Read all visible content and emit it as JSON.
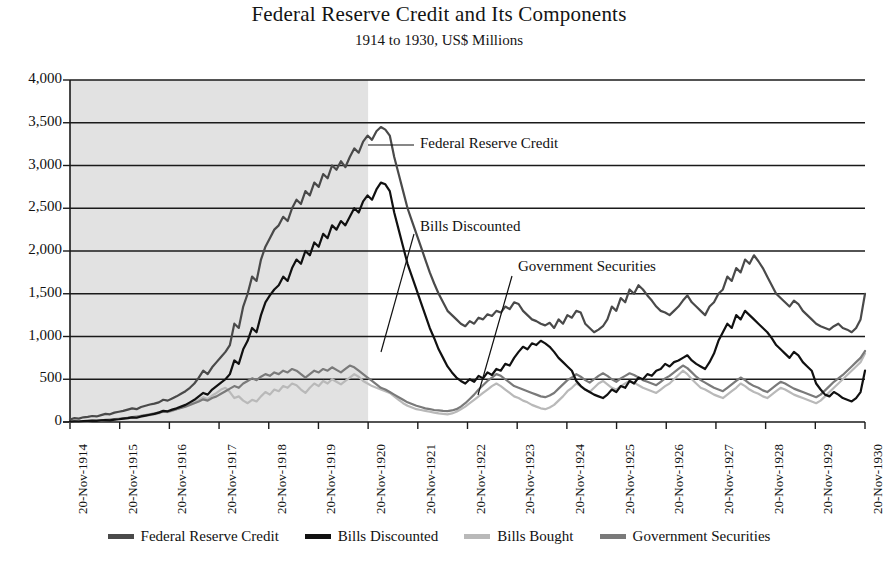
{
  "header": {
    "title": "Federal Reserve Credit and Its Components",
    "subtitle": "1914 to 1930, US$ Millions"
  },
  "footer": {
    "fragment": ""
  },
  "colors": {
    "federal_reserve_credit": "#4a4a4a",
    "bills_discounted": "#111111",
    "bills_bought": "#b9b9b9",
    "government_securities": "#7a7a7a",
    "shading": "#e2e2e2",
    "gridline": "#1a1a1a",
    "axis": "#1a1a1a"
  },
  "legend": {
    "position": "bottom",
    "items": [
      {
        "label": "Federal Reserve Credit",
        "color": "#4a4a4a"
      },
      {
        "label": "Bills Discounted",
        "color": "#111111"
      },
      {
        "label": "Bills Bought",
        "color": "#b9b9b9"
      },
      {
        "label": "Government Securities",
        "color": "#7a7a7a"
      }
    ]
  },
  "annotations": [
    {
      "label": "Federal Reserve Credit",
      "x": 420,
      "y": 145
    },
    {
      "label": "Bills Discounted",
      "x": 420,
      "y": 228
    },
    {
      "label": "Government Securities",
      "x": 518,
      "y": 268
    }
  ],
  "chart_data": {
    "type": "line",
    "title": "Federal Reserve Credit and Its Components",
    "subtitle": "1914 to 1930, US$ Millions",
    "xlabel": "",
    "ylabel": "US$ Millions",
    "ylim": [
      0,
      4000
    ],
    "yticks": [
      "0",
      "500",
      "1,000",
      "1,500",
      "2,000",
      "2,500",
      "3,000",
      "3,500",
      "4,000"
    ],
    "ytick_values": [
      0,
      500,
      1000,
      1500,
      2000,
      2500,
      3000,
      3500,
      4000
    ],
    "grid": true,
    "xtick_labels": [
      "20-Nov-1914",
      "20-Nov-1915",
      "20-Nov-1916",
      "20-Nov-1917",
      "20-Nov-1918",
      "20-Nov-1919",
      "20-Nov-1920",
      "20-Nov-1921",
      "20-Nov-1922",
      "20-Nov-1923",
      "20-Nov-1924",
      "20-Nov-1925",
      "20-Nov-1926",
      "20-Nov-1927",
      "20-Nov-1928",
      "20-Nov-1929",
      "20-Nov-1930"
    ],
    "shaded_region": {
      "from": "20-Nov-1914",
      "to": "20-Nov-1920",
      "color": "#e2e2e2"
    },
    "series": [
      {
        "name": "Federal Reserve Credit",
        "color": "#4a4a4a",
        "values": [
          30,
          45,
          40,
          55,
          60,
          70,
          65,
          80,
          95,
          90,
          110,
          120,
          130,
          145,
          160,
          150,
          175,
          190,
          205,
          215,
          230,
          260,
          250,
          275,
          300,
          330,
          360,
          400,
          450,
          520,
          600,
          560,
          640,
          700,
          760,
          820,
          900,
          1150,
          1100,
          1350,
          1500,
          1700,
          1650,
          1900,
          2050,
          2150,
          2250,
          2300,
          2400,
          2350,
          2500,
          2600,
          2550,
          2700,
          2650,
          2800,
          2750,
          2900,
          2850,
          3000,
          2950,
          3050,
          2980,
          3100,
          3200,
          3150,
          3280,
          3350,
          3300,
          3400,
          3450,
          3420,
          3350,
          3100,
          2900,
          2700,
          2500,
          2350,
          2200,
          2050,
          1900,
          1750,
          1620,
          1500,
          1400,
          1300,
          1250,
          1200,
          1150,
          1120,
          1180,
          1150,
          1220,
          1200,
          1260,
          1240,
          1300,
          1280,
          1350,
          1320,
          1400,
          1380,
          1300,
          1250,
          1200,
          1180,
          1150,
          1130,
          1160,
          1100,
          1200,
          1150,
          1250,
          1220,
          1300,
          1280,
          1150,
          1100,
          1050,
          1080,
          1120,
          1200,
          1350,
          1300,
          1450,
          1400,
          1550,
          1500,
          1600,
          1550,
          1480,
          1420,
          1350,
          1300,
          1280,
          1250,
          1300,
          1350,
          1420,
          1480,
          1400,
          1350,
          1300,
          1250,
          1350,
          1400,
          1500,
          1550,
          1700,
          1650,
          1800,
          1750,
          1900,
          1850,
          1950,
          1880,
          1800,
          1700,
          1600,
          1500,
          1450,
          1400,
          1350,
          1420,
          1380,
          1300,
          1250,
          1200,
          1150,
          1120,
          1100,
          1080,
          1120,
          1150,
          1100,
          1080,
          1050,
          1100,
          1200,
          1500
        ],
        "peak": 3450,
        "peak_date": "20-Nov-1920"
      },
      {
        "name": "Bills Discounted",
        "color": "#111111",
        "values": [
          5,
          8,
          6,
          10,
          12,
          15,
          14,
          18,
          22,
          20,
          28,
          32,
          40,
          45,
          55,
          50,
          65,
          75,
          85,
          95,
          110,
          130,
          125,
          145,
          160,
          180,
          200,
          230,
          260,
          300,
          340,
          320,
          380,
          420,
          460,
          500,
          560,
          720,
          680,
          850,
          950,
          1100,
          1050,
          1250,
          1400,
          1480,
          1550,
          1600,
          1700,
          1650,
          1800,
          1900,
          1850,
          2000,
          1950,
          2100,
          2050,
          2200,
          2150,
          2300,
          2250,
          2350,
          2300,
          2400,
          2500,
          2450,
          2580,
          2650,
          2600,
          2720,
          2800,
          2780,
          2700,
          2450,
          2250,
          2050,
          1850,
          1700,
          1550,
          1400,
          1250,
          1100,
          980,
          850,
          750,
          650,
          580,
          520,
          480,
          450,
          500,
          470,
          540,
          510,
          580,
          550,
          620,
          600,
          680,
          660,
          750,
          820,
          880,
          850,
          920,
          900,
          950,
          920,
          880,
          820,
          750,
          700,
          650,
          600,
          480,
          420,
          380,
          350,
          320,
          300,
          280,
          320,
          380,
          350,
          420,
          400,
          480,
          450,
          520,
          500,
          560,
          540,
          600,
          620,
          680,
          650,
          700,
          720,
          750,
          780,
          720,
          680,
          650,
          620,
          700,
          800,
          950,
          1050,
          1150,
          1100,
          1250,
          1200,
          1300,
          1250,
          1200,
          1150,
          1100,
          1050,
          980,
          900,
          850,
          800,
          750,
          820,
          780,
          700,
          650,
          600,
          450,
          380,
          320,
          300,
          350,
          320,
          280,
          260,
          240,
          280,
          350,
          600
        ],
        "peak": 2800,
        "peak_date": "20-Nov-1920"
      },
      {
        "name": "Bills Bought",
        "color": "#b9b9b9",
        "values": [
          2,
          4,
          6,
          8,
          10,
          12,
          15,
          18,
          22,
          25,
          30,
          35,
          40,
          45,
          50,
          55,
          60,
          70,
          80,
          90,
          100,
          120,
          115,
          130,
          150,
          170,
          190,
          210,
          230,
          260,
          290,
          270,
          310,
          340,
          380,
          400,
          350,
          280,
          300,
          250,
          220,
          260,
          240,
          300,
          350,
          320,
          380,
          360,
          420,
          400,
          450,
          430,
          380,
          340,
          400,
          450,
          420,
          480,
          450,
          500,
          470,
          440,
          480,
          520,
          560,
          530,
          480,
          450,
          420,
          400,
          380,
          360,
          340,
          300,
          260,
          220,
          190,
          170,
          150,
          140,
          130,
          120,
          110,
          100,
          95,
          90,
          100,
          120,
          150,
          180,
          220,
          260,
          300,
          340,
          380,
          420,
          450,
          420,
          380,
          340,
          300,
          280,
          250,
          230,
          200,
          180,
          160,
          150,
          170,
          200,
          250,
          300,
          360,
          400,
          450,
          420,
          380,
          350,
          400,
          450,
          480,
          440,
          400,
          380,
          420,
          450,
          480,
          460,
          430,
          400,
          380,
          360,
          340,
          380,
          420,
          450,
          500,
          550,
          600,
          560,
          500,
          450,
          400,
          380,
          350,
          320,
          300,
          280,
          320,
          360,
          400,
          450,
          420,
          380,
          350,
          330,
          300,
          280,
          320,
          360,
          400,
          380,
          350,
          320,
          300,
          280,
          260,
          240,
          220,
          250,
          300,
          350,
          400,
          450,
          500,
          550,
          600,
          650,
          700,
          800
        ]
      },
      {
        "name": "Government Securities",
        "color": "#7a7a7a",
        "values": [
          3,
          5,
          7,
          9,
          11,
          14,
          17,
          20,
          24,
          28,
          33,
          38,
          44,
          50,
          57,
          64,
          72,
          80,
          90,
          100,
          112,
          125,
          120,
          135,
          150,
          165,
          180,
          200,
          220,
          240,
          265,
          250,
          280,
          300,
          330,
          360,
          390,
          420,
          400,
          450,
          480,
          510,
          490,
          530,
          560,
          540,
          580,
          560,
          600,
          580,
          620,
          600,
          560,
          520,
          560,
          600,
          580,
          620,
          600,
          640,
          610,
          580,
          620,
          660,
          640,
          600,
          560,
          520,
          480,
          440,
          400,
          380,
          350,
          320,
          290,
          260,
          230,
          210,
          190,
          175,
          160,
          150,
          140,
          135,
          130,
          128,
          135,
          150,
          180,
          220,
          270,
          320,
          380,
          430,
          480,
          520,
          560,
          540,
          500,
          460,
          420,
          400,
          380,
          360,
          340,
          320,
          300,
          290,
          310,
          340,
          390,
          440,
          490,
          520,
          560,
          530,
          490,
          460,
          500,
          540,
          570,
          540,
          500,
          470,
          510,
          540,
          570,
          550,
          520,
          490,
          470,
          450,
          430,
          470,
          510,
          540,
          580,
          620,
          660,
          630,
          580,
          530,
          490,
          460,
          430,
          400,
          380,
          360,
          400,
          440,
          480,
          520,
          490,
          450,
          420,
          400,
          370,
          350,
          390,
          430,
          470,
          450,
          420,
          390,
          370,
          350,
          330,
          310,
          290,
          320,
          370,
          420,
          470,
          510,
          550,
          600,
          650,
          700,
          750,
          830
        ]
      }
    ]
  }
}
